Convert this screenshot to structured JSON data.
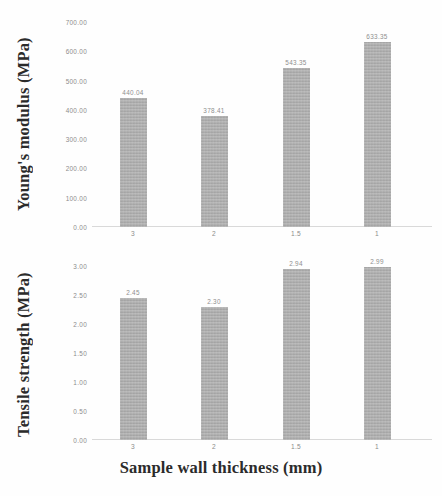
{
  "chart_data": [
    {
      "type": "bar",
      "id": "youngs-modulus",
      "title": "",
      "xlabel": "",
      "ylabel": "Young's modulus (MPa)",
      "categories": [
        "3",
        "2",
        "1.5",
        "1"
      ],
      "values": [
        440.04,
        378.41,
        543.35,
        633.35
      ],
      "value_labels": [
        "440.04",
        "378.41",
        "543.35",
        "633.35"
      ],
      "ylim": [
        0,
        700
      ],
      "yticks": [
        0,
        100,
        200,
        300,
        400,
        500,
        600,
        700
      ],
      "ytick_labels": [
        "0.00",
        "100.00",
        "200.00",
        "300.00",
        "400.00",
        "500.00",
        "600.00",
        "700.00"
      ],
      "grid": false,
      "legend": "none",
      "bar_color": "#a9a9a9"
    },
    {
      "type": "bar",
      "id": "tensile-strength",
      "title": "",
      "xlabel": "Sample wall thickness (mm)",
      "ylabel": "Tensile strength (MPa)",
      "categories": [
        "3",
        "2",
        "1.5",
        "1"
      ],
      "values": [
        2.45,
        2.3,
        2.94,
        2.99
      ],
      "value_labels": [
        "2.45",
        "2.30",
        "2.94",
        "2.99"
      ],
      "ylim": [
        0,
        3
      ],
      "yticks": [
        0,
        0.5,
        1,
        1.5,
        2,
        2.5,
        3
      ],
      "ytick_labels": [
        "0.00",
        "0.50",
        "1.00",
        "1.50",
        "2.00",
        "2.50",
        "3.00"
      ],
      "grid": false,
      "legend": "none",
      "bar_color": "#a9a9a9"
    }
  ],
  "figure": {
    "xaxis_title": "Sample wall thickness (mm)"
  }
}
